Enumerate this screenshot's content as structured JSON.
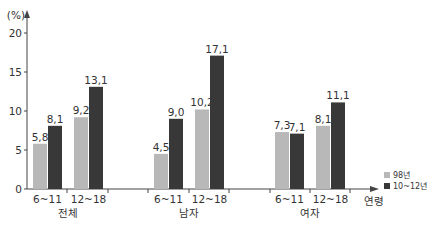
{
  "chart_data": {
    "type": "bar",
    "title": "",
    "xlabel": "연령",
    "ylabel": "(%)",
    "ylim": [
      0,
      20
    ],
    "yticks": [
      0,
      5,
      10,
      15,
      20
    ],
    "grid": false,
    "legend_position": "right-bottom",
    "groups": [
      {
        "label": "전체",
        "categories": [
          "6~11",
          "12~18"
        ]
      },
      {
        "label": "남자",
        "categories": [
          "6~11",
          "12~18"
        ]
      },
      {
        "label": "여자",
        "categories": [
          "6~11",
          "12~18"
        ]
      }
    ],
    "categories": [
      "전체 6~11",
      "전체 12~18",
      "남자 6~11",
      "남자 12~18",
      "여자 6~11",
      "여자 12~18"
    ],
    "series": [
      {
        "name": "98년",
        "color": "#b8b8b8",
        "values": [
          5.8,
          9.2,
          4.5,
          10.2,
          7.3,
          8.1
        ],
        "labels": [
          "5,8",
          "9,2",
          "4,5",
          "10,2",
          "7,3",
          "8,1"
        ]
      },
      {
        "name": "10~12년",
        "color": "#383838",
        "values": [
          8.1,
          13.1,
          9.0,
          17.1,
          7.1,
          11.1
        ],
        "labels": [
          "8,1",
          "13,1",
          "9,0",
          "17,1",
          "7,1",
          "11,1"
        ]
      }
    ]
  },
  "axis": {
    "y_unit": "(%)",
    "x_title": "연령"
  },
  "legend": [
    {
      "label": "98년",
      "color": "#b8b8b8"
    },
    {
      "label": "10~12년",
      "color": "#383838"
    }
  ]
}
